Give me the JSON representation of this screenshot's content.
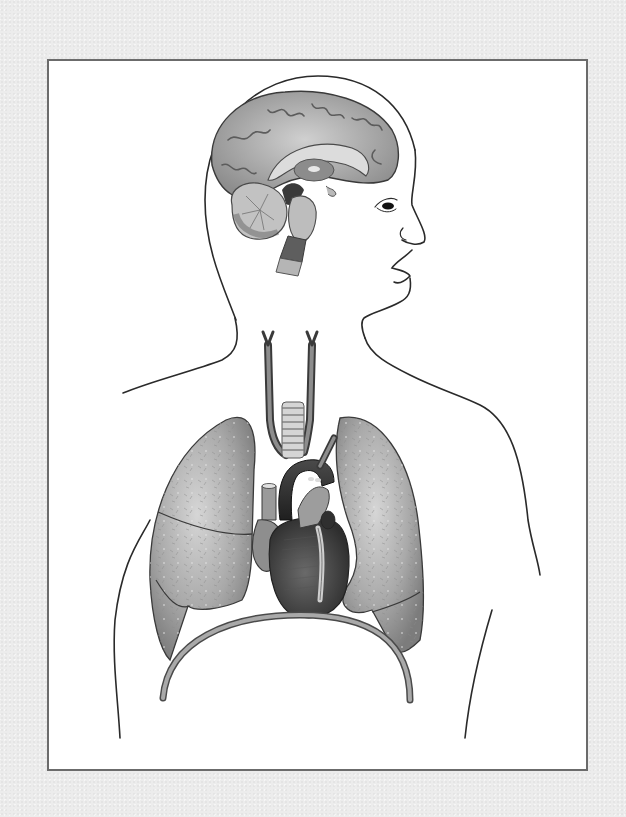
{
  "figure": {
    "title": "",
    "description": "Unlabeled anatomical illustration of a human head and torso in profile/front view showing brain (sagittal section), trachea, carotid arteries, heart with aortic arch, lungs and diaphragm",
    "background_color": "#ececec",
    "frame_color": "#6b6b6b",
    "canvas_color": "#ffffff"
  },
  "organs": [
    {
      "id": "brain",
      "name": "Brain",
      "parts": [
        "cerebrum",
        "corpus callosum",
        "thalamus",
        "cerebellum",
        "brainstem",
        "spinal cord"
      ]
    },
    {
      "id": "carotid-arteries",
      "name": "Carotid arteries"
    },
    {
      "id": "trachea",
      "name": "Trachea"
    },
    {
      "id": "aorta",
      "name": "Aortic arch"
    },
    {
      "id": "heart",
      "name": "Heart"
    },
    {
      "id": "right-lung",
      "name": "Right lung",
      "lobes": 3
    },
    {
      "id": "left-lung",
      "name": "Left lung",
      "lobes": 2
    },
    {
      "id": "diaphragm",
      "name": "Diaphragm"
    }
  ],
  "labels": []
}
